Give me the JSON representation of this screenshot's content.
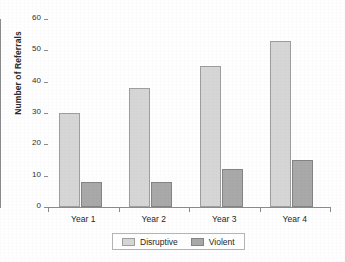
{
  "chart_data": {
    "type": "bar",
    "title": "",
    "subtitle": "",
    "xlabel": "",
    "ylabel": "Number of Referrals",
    "categories": [
      "Year 1",
      "Year 2",
      "Year 3",
      "Year 4"
    ],
    "series": [
      {
        "name": "Disruptive",
        "values": [
          30,
          38,
          45,
          53
        ],
        "color": "#d6d6d6"
      },
      {
        "name": "Violent",
        "values": [
          8,
          8,
          12,
          15
        ],
        "color": "#a9a9a9"
      }
    ],
    "ylim": [
      0,
      60
    ],
    "ytick_labels": [
      "0",
      "10",
      "20",
      "30",
      "40",
      "50",
      "60"
    ],
    "ytick_values": [
      0,
      10,
      20,
      30,
      40,
      50,
      60
    ],
    "grid": false,
    "legend_position": "bottom",
    "legend_entries": [
      "Disruptive",
      "Violent"
    ],
    "annotations": []
  },
  "axes": {
    "y_title": "Number of Referrals",
    "y_ticks": [
      {
        "label": "60",
        "value": 60
      },
      {
        "label": "50",
        "value": 50
      },
      {
        "label": "40",
        "value": 40
      },
      {
        "label": "30",
        "value": 30
      },
      {
        "label": "20",
        "value": 20
      },
      {
        "label": "10",
        "value": 10
      },
      {
        "label": "0",
        "value": 0
      }
    ],
    "x_labels": [
      "Year 1",
      "Year 2",
      "Year 3",
      "Year 4"
    ],
    "axis_color": "#8c8c8c"
  },
  "legend": {
    "items": [
      {
        "label": "Disruptive",
        "swatch": "#d6d6d6"
      },
      {
        "label": "Violent",
        "swatch": "#a9a9a9"
      }
    ]
  },
  "colors": {
    "disruptive": "#d6d6d6",
    "violent": "#a9a9a9",
    "axis": "#8c8c8c",
    "text": "#262626",
    "background": "#fefefe"
  }
}
